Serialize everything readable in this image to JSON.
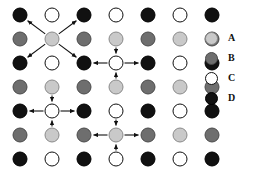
{
  "figure": {
    "title": ""
  },
  "chart_data": {
    "type": "scatter",
    "title": "",
    "xlabel": "",
    "ylabel": "",
    "grid": false,
    "legend_position": "right",
    "species": [
      {
        "key": "A",
        "label": "A",
        "color": "#c9c9c9",
        "edge": "#8a8a8a"
      },
      {
        "key": "B",
        "label": "B",
        "color": "#6e6e6e",
        "edge": "#4a4a4a"
      },
      {
        "key": "C",
        "label": "C",
        "color": "#ffffff",
        "edge": "#111111"
      },
      {
        "key": "D",
        "label": "D",
        "color": "#111111",
        "edge": "#000000"
      }
    ],
    "columns": 7,
    "rows": 7,
    "col_x": [
      20,
      52,
      84,
      116,
      148,
      180,
      212
    ],
    "row_y": [
      15,
      39,
      63,
      87,
      111,
      135,
      159
    ],
    "lattice": [
      [
        "D",
        "C",
        "D",
        "C",
        "D",
        "C",
        "D"
      ],
      [
        "B",
        "A",
        "B",
        "A",
        "B",
        "A",
        "B"
      ],
      [
        "D",
        "C",
        "D",
        "C",
        "D",
        "C",
        "D"
      ],
      [
        "B",
        "A",
        "B",
        "A",
        "B",
        "A",
        "B"
      ],
      [
        "D",
        "C",
        "D",
        "C",
        "D",
        "C",
        "D"
      ],
      [
        "B",
        "A",
        "B",
        "A",
        "B",
        "A",
        "B"
      ],
      [
        "D",
        "C",
        "D",
        "C",
        "D",
        "C",
        "D"
      ]
    ],
    "centers": [
      {
        "name": "center-a-diagonal",
        "row": 1,
        "col": 1,
        "species": "A",
        "arrow_style": "diagonal-out",
        "neighbors": "D"
      },
      {
        "name": "center-d-cross",
        "row": 2,
        "col": 3,
        "species": "D",
        "arrow_style": "vertical-in-horizontal-out",
        "neighbors": "B,C"
      },
      {
        "name": "center-c-cross",
        "row": 4,
        "col": 1,
        "species": "C",
        "arrow_style": "vertical-in-horizontal-out",
        "neighbors": "A,D"
      },
      {
        "name": "center-b-cross",
        "row": 5,
        "col": 3,
        "species": "B",
        "arrow_style": "vertical-in-horizontal-out",
        "neighbors": "D,A"
      }
    ],
    "marker_radius_px": 7.5
  },
  "legend": {
    "items": [
      {
        "label": "A",
        "species": "A"
      },
      {
        "label": "B",
        "species": "B"
      },
      {
        "label": "C",
        "species": "C"
      },
      {
        "label": "D",
        "species": "D"
      }
    ]
  }
}
